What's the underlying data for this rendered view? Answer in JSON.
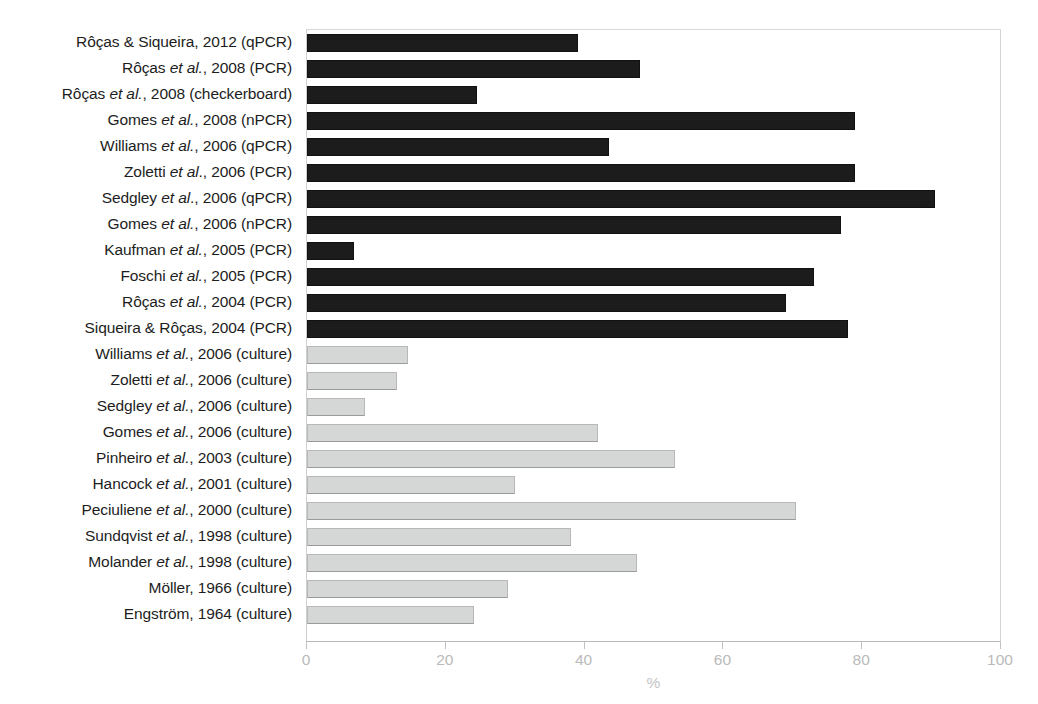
{
  "chart_data": {
    "type": "bar",
    "orientation": "horizontal",
    "title": "",
    "xlabel": "%",
    "ylabel": "",
    "xlim": [
      0,
      100
    ],
    "xticks": [
      0,
      20,
      40,
      60,
      80,
      100
    ],
    "xtick_labels": [
      "0",
      "20",
      "40",
      "60",
      "80",
      "100"
    ],
    "grid": false,
    "legend": null,
    "colors": {
      "molecular": "#1c1c1c",
      "culture": "#d5d7d6",
      "axis": "#c2c2c2",
      "tick_text": "#b9bbba",
      "label_text": "#1d1d1d"
    },
    "categories": [
      "Rôças & Siqueira, 2012 (qPCR)",
      "Rôças et al., 2008 (PCR)",
      "Rôças et al., 2008 (checkerboard)",
      "Gomes et al., 2008 (nPCR)",
      "Williams et al., 2006 (qPCR)",
      "Zoletti et al., 2006 (PCR)",
      "Sedgley et al., 2006 (qPCR)",
      "Gomes et al., 2006 (nPCR)",
      "Kaufman et al., 2005 (PCR)",
      "Foschi et al., 2005 (PCR)",
      "Rôças et al., 2004 (PCR)",
      "Siqueira & Rôças, 2004 (PCR)",
      "Williams et al., 2006 (culture)",
      "Zoletti et al., 2006 (culture)",
      "Sedgley et al., 2006 (culture)",
      "Gomes et al., 2006 (culture)",
      "Pinheiro et al., 2003 (culture)",
      "Hancock et al., 2001 (culture)",
      "Peciuliene et al., 2000 (culture)",
      "Sundqvist et al., 1998 (culture)",
      "Molander et al., 1998 (culture)",
      "Möller, 1966 (culture)",
      "Engström, 1964 (culture)"
    ],
    "values": [
      39,
      48,
      24.5,
      79,
      43.5,
      79,
      90.5,
      77,
      6.8,
      73,
      69,
      78,
      14.5,
      13,
      8.3,
      42,
      53,
      30,
      70.5,
      38,
      47.5,
      29,
      24
    ],
    "bar_styles": [
      "dark",
      "dark",
      "dark",
      "dark",
      "dark",
      "dark",
      "dark",
      "dark",
      "dark",
      "dark",
      "dark",
      "dark",
      "light",
      "light",
      "light",
      "light",
      "light",
      "light",
      "light",
      "light",
      "light",
      "light",
      "light"
    ],
    "label_parts": [
      {
        "pre": "Rôças & Siqueira, 2012 (qPCR)",
        "ital": "",
        "post": ""
      },
      {
        "pre": "Rôças ",
        "ital": "et al.",
        "post": ", 2008 (PCR)"
      },
      {
        "pre": "Rôças ",
        "ital": "et al.",
        "post": ", 2008 (checkerboard)"
      },
      {
        "pre": "Gomes ",
        "ital": "et al.",
        "post": ", 2008 (nPCR)"
      },
      {
        "pre": "Williams ",
        "ital": "et al.",
        "post": ", 2006 (qPCR)"
      },
      {
        "pre": "Zoletti ",
        "ital": "et al",
        "post": "., 2006 (PCR)"
      },
      {
        "pre": "Sedgley ",
        "ital": "et al",
        "post": "., 2006 (qPCR)"
      },
      {
        "pre": "Gomes ",
        "ital": "et al.",
        "post": ", 2006 (nPCR)"
      },
      {
        "pre": "Kaufman ",
        "ital": "et al.",
        "post": ", 2005 (PCR)"
      },
      {
        "pre": "Foschi ",
        "ital": "et al.",
        "post": ", 2005 (PCR)"
      },
      {
        "pre": "Rôças ",
        "ital": "et al.",
        "post": ", 2004 (PCR)"
      },
      {
        "pre": "Siqueira & Rôças, 2004 (PCR)",
        "ital": "",
        "post": ""
      },
      {
        "pre": "Williams ",
        "ital": "et al.",
        "post": ", 2006 (culture)"
      },
      {
        "pre": "Zoletti ",
        "ital": "et al.",
        "post": ", 2006 (culture)"
      },
      {
        "pre": "Sedgley ",
        "ital": "et al.",
        "post": ", 2006 (culture)"
      },
      {
        "pre": "Gomes ",
        "ital": "et al.",
        "post": ", 2006 (culture)"
      },
      {
        "pre": "Pinheiro ",
        "ital": "et al.",
        "post": ", 2003 (culture)"
      },
      {
        "pre": "Hancock ",
        "ital": "et al.",
        "post": ", 2001 (culture)"
      },
      {
        "pre": "Peciuliene ",
        "ital": "et al.",
        "post": ", 2000 (culture)"
      },
      {
        "pre": "Sundqvist ",
        "ital": "et al.",
        "post": ", 1998 (culture)"
      },
      {
        "pre": "Molander ",
        "ital": "et al.",
        "post": ", 1998 (culture)"
      },
      {
        "pre": "Möller, 1966 (culture)",
        "ital": "",
        "post": ""
      },
      {
        "pre": "Engström, 1964 (culture)",
        "ital": "",
        "post": ""
      }
    ]
  }
}
